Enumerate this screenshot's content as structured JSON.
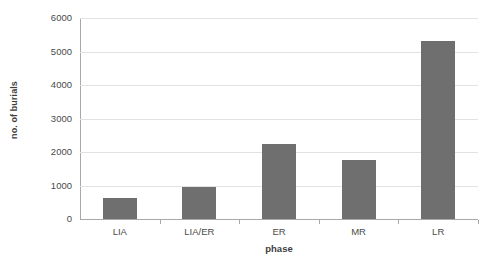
{
  "chart_data": {
    "type": "bar",
    "title": "",
    "categories": [
      "LIA",
      "LIA/ER",
      "ER",
      "MR",
      "LR"
    ],
    "values": [
      620,
      950,
      2230,
      1760,
      5300
    ],
    "xlabel": "phase",
    "ylabel": "no. of burials",
    "ylim": [
      0,
      6000
    ],
    "yticks": [
      0,
      1000,
      2000,
      3000,
      4000,
      5000,
      6000
    ],
    "ytick_labels": [
      "0",
      "1000",
      "2000",
      "3000",
      "4000",
      "5000",
      "6000"
    ],
    "grid": true,
    "legend": false,
    "series": [
      {
        "name": "no. of burials",
        "color": "#6f6f6f",
        "values": [
          620,
          950,
          2230,
          1760,
          5300
        ]
      }
    ]
  },
  "style": {
    "bar_color": "#6f6f6f",
    "gridline_color": "#e2e2e2",
    "axis_color": "#a8a8a8",
    "text_color": "#4a4a4a",
    "background": "#ffffff"
  }
}
